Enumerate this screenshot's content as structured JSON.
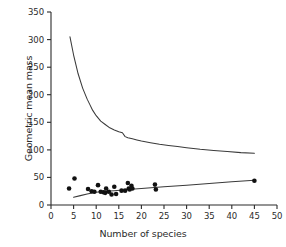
{
  "figure": {
    "background_color": "#ffffff",
    "ink_color": "#2b2b2b"
  },
  "chart_data": {
    "type": "scatter",
    "title": "",
    "xlabel": "Number of species",
    "ylabel": "Geometric mean mass",
    "xlim": [
      0,
      50
    ],
    "ylim": [
      0,
      350
    ],
    "xticks": [
      0,
      5,
      10,
      15,
      20,
      25,
      30,
      35,
      40,
      45,
      50
    ],
    "yticks": [
      0,
      50,
      100,
      150,
      200,
      250,
      300,
      350
    ],
    "xtick_labels": [
      "0",
      "5",
      "10",
      "15",
      "20",
      "25",
      "30",
      "35",
      "40",
      "45",
      "50"
    ],
    "ytick_labels": [
      "0",
      "50",
      "100",
      "150",
      "200",
      "250",
      "300",
      "350"
    ],
    "grid": false,
    "legend": null,
    "axes_style": "left-and-bottom-spines-only",
    "marker": "filled-circle",
    "marker_color": "#111111",
    "line_color": "#3a3a3a",
    "points": [
      {
        "x": 4.0,
        "y": 30
      },
      {
        "x": 5.2,
        "y": 48
      },
      {
        "x": 8.2,
        "y": 29
      },
      {
        "x": 9.0,
        "y": 25
      },
      {
        "x": 9.6,
        "y": 24
      },
      {
        "x": 10.4,
        "y": 36
      },
      {
        "x": 11.0,
        "y": 24
      },
      {
        "x": 11.6,
        "y": 23
      },
      {
        "x": 12.0,
        "y": 22
      },
      {
        "x": 12.2,
        "y": 30
      },
      {
        "x": 12.8,
        "y": 24
      },
      {
        "x": 13.4,
        "y": 19
      },
      {
        "x": 14.0,
        "y": 33
      },
      {
        "x": 14.4,
        "y": 20
      },
      {
        "x": 15.6,
        "y": 26
      },
      {
        "x": 16.4,
        "y": 26
      },
      {
        "x": 17.0,
        "y": 40
      },
      {
        "x": 17.2,
        "y": 30
      },
      {
        "x": 17.4,
        "y": 28
      },
      {
        "x": 17.8,
        "y": 35
      },
      {
        "x": 18.0,
        "y": 30
      },
      {
        "x": 23.0,
        "y": 37
      },
      {
        "x": 23.2,
        "y": 28
      },
      {
        "x": 45.0,
        "y": 44
      }
    ],
    "series": [
      {
        "name": "upper-declining-curve",
        "type": "line",
        "x": [
          4.2,
          5.0,
          6.0,
          7.0,
          8.0,
          8.6,
          9.2,
          10.0,
          11.0,
          12.0,
          13.0,
          14.0,
          15.0,
          15.8,
          16.4,
          17.0,
          18.0,
          19.0,
          20.0,
          22.0,
          24.0,
          26.0,
          28.0,
          30.0,
          33.0,
          36.0,
          39.0,
          42.0,
          45.0
        ],
        "y": [
          305,
          272,
          238,
          212,
          192,
          182,
          172,
          162,
          152,
          146,
          140,
          136,
          133,
          131,
          124,
          122,
          120,
          118,
          116,
          113,
          110,
          108,
          106,
          104,
          101,
          99,
          97,
          95,
          94
        ]
      },
      {
        "name": "lower-fitted-trend",
        "type": "line",
        "x": [
          5.0,
          6.5,
          8.0,
          10.0,
          12.0,
          14.0,
          17.0,
          20.0,
          25.0,
          30.0,
          35.0,
          40.0,
          45.0
        ],
        "y": [
          14,
          17,
          20,
          23,
          25,
          26,
          28,
          30,
          33,
          36,
          39,
          42,
          45
        ]
      }
    ]
  }
}
